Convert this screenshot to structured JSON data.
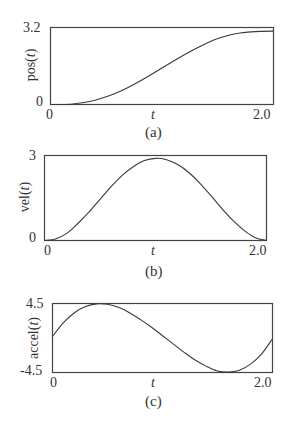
{
  "colors": {
    "line": "#3a3a3a",
    "frame": "#444444",
    "background": "#ffffff"
  },
  "panels": [
    {
      "id": "a",
      "caption": "(a)",
      "ylabel": "pos(t)",
      "ylabel_prefix": "pos(",
      "ylabel_var": "t",
      "ylabel_suffix": ")",
      "ymax_label": "3.2",
      "ymin_label": "0",
      "xmin_label": "0",
      "xmax_label": "2.0",
      "xlabel": "t"
    },
    {
      "id": "b",
      "caption": "(b)",
      "ylabel": "vel(t)",
      "ylabel_prefix": "vel(",
      "ylabel_var": "t",
      "ylabel_suffix": ")",
      "ymax_label": "3",
      "ymin_label": "0",
      "xmin_label": "0",
      "xmax_label": "2.0",
      "xlabel": "t"
    },
    {
      "id": "c",
      "caption": "(c)",
      "ylabel": "accel(t)",
      "ylabel_prefix": "accel(",
      "ylabel_var": "t",
      "ylabel_suffix": ")",
      "ymax_label": "4.5",
      "ymin_label": "-4.5",
      "xmin_label": "0",
      "xmax_label": "2.0",
      "xlabel": "t"
    }
  ],
  "chart_data": [
    {
      "type": "line",
      "title": "(a)",
      "xlabel": "t",
      "ylabel": "pos(t)",
      "xlim": [
        0,
        2.0
      ],
      "ylim": [
        0,
        3.2
      ],
      "xticks": [
        "0",
        "2.0"
      ],
      "yticks": [
        "0",
        "3.2"
      ],
      "grid": false,
      "legend": null,
      "x": [
        0,
        0.1,
        0.2,
        0.3,
        0.4,
        0.5,
        0.6,
        0.7,
        0.8,
        0.9,
        1.0,
        1.1,
        1.2,
        1.3,
        1.4,
        1.5,
        1.6,
        1.7,
        1.8,
        1.9,
        2.0
      ],
      "series": [
        {
          "name": "pos(t)",
          "values": [
            0.0,
            0.0,
            0.02,
            0.08,
            0.18,
            0.32,
            0.5,
            0.72,
            0.97,
            1.24,
            1.52,
            1.8,
            2.07,
            2.32,
            2.55,
            2.74,
            2.88,
            2.97,
            3.02,
            3.04,
            3.05
          ]
        }
      ]
    },
    {
      "type": "line",
      "title": "(b)",
      "xlabel": "t",
      "ylabel": "vel(t)",
      "xlim": [
        0,
        2.0
      ],
      "ylim": [
        0,
        3
      ],
      "xticks": [
        "0",
        "2.0"
      ],
      "yticks": [
        "0",
        "3"
      ],
      "grid": false,
      "legend": null,
      "x": [
        0,
        0.1,
        0.2,
        0.3,
        0.4,
        0.5,
        0.6,
        0.7,
        0.8,
        0.9,
        1.0,
        1.1,
        1.2,
        1.3,
        1.4,
        1.5,
        1.6,
        1.7,
        1.8,
        1.9,
        2.0
      ],
      "series": [
        {
          "name": "vel(t)",
          "values": [
            0.0,
            0.05,
            0.25,
            0.6,
            1.0,
            1.45,
            1.9,
            2.3,
            2.6,
            2.82,
            2.9,
            2.85,
            2.68,
            2.4,
            2.02,
            1.58,
            1.12,
            0.7,
            0.35,
            0.1,
            0.0
          ]
        }
      ]
    },
    {
      "type": "line",
      "title": "(c)",
      "xlabel": "t",
      "ylabel": "accel(t)",
      "xlim": [
        0,
        2.0
      ],
      "ylim": [
        -4.5,
        4.5
      ],
      "xticks": [
        "0",
        "2.0"
      ],
      "yticks": [
        "-4.5",
        "4.5"
      ],
      "grid": false,
      "legend": null,
      "x": [
        0,
        0.1,
        0.2,
        0.3,
        0.4,
        0.5,
        0.6,
        0.7,
        0.8,
        0.9,
        1.0,
        1.1,
        1.2,
        1.3,
        1.4,
        1.5,
        1.6,
        1.7,
        1.8,
        1.9,
        2.0
      ],
      "series": [
        {
          "name": "accel(t)",
          "values": [
            0.2,
            2.0,
            3.3,
            4.1,
            4.45,
            4.4,
            4.0,
            3.3,
            2.4,
            1.4,
            0.3,
            -0.8,
            -1.9,
            -2.9,
            -3.7,
            -4.3,
            -4.45,
            -4.2,
            -3.4,
            -2.1,
            -0.1
          ]
        }
      ]
    }
  ]
}
